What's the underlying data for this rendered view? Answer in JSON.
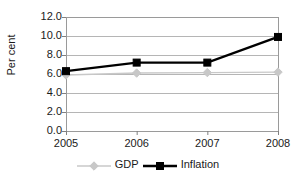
{
  "chart_data": {
    "type": "line",
    "title": "",
    "xlabel": "",
    "ylabel": "Per cent",
    "categories": [
      "2005",
      "2006",
      "2007",
      "2008"
    ],
    "ylim": [
      0.0,
      12.0
    ],
    "ytick_step": 2.0,
    "yticks": [
      "0.0",
      "2.0",
      "4.0",
      "6.0",
      "8.0",
      "10.0",
      "12.0"
    ],
    "grid": true,
    "legend_position": "bottom",
    "series": [
      {
        "name": "GDP",
        "values": [
          5.9,
          6.1,
          6.15,
          6.2
        ],
        "color": "#c8c8c8",
        "marker": "diamond",
        "line_width": 1.4
      },
      {
        "name": "Inflation",
        "values": [
          6.3,
          7.2,
          7.2,
          9.9
        ],
        "color": "#000000",
        "marker": "square",
        "line_width": 2.4
      }
    ]
  },
  "axis": {
    "border_color": "#9a9a9a",
    "grid_color": "#b5b5b5",
    "tick_color": "#808080"
  }
}
